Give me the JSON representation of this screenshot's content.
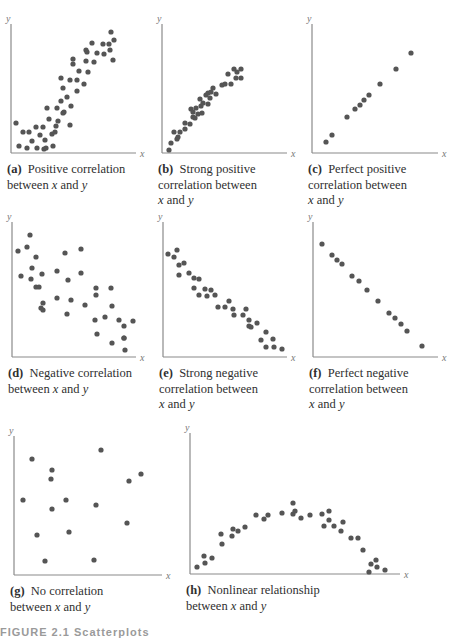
{
  "figure_label": "FIGURE 2.1 Scatterplots",
  "chart_data": [
    {
      "id": "a",
      "type": "scatter",
      "title": "(a) Positive correlation between x and y",
      "letter": "(a)",
      "caption_lines": [
        "Positive correlation",
        "between x and y"
      ],
      "xlabel": "x",
      "ylabel": "y",
      "axes": {
        "x0": 11,
        "y0": 153,
        "x1": 136,
        "ytop": 24
      },
      "points": [
        [
          16,
          123
        ],
        [
          19,
          146
        ],
        [
          23,
          132
        ],
        [
          27,
          148
        ],
        [
          29,
          132
        ],
        [
          32,
          141
        ],
        [
          36,
          127
        ],
        [
          37,
          148
        ],
        [
          40,
          135
        ],
        [
          43,
          127
        ],
        [
          44,
          149
        ],
        [
          45,
          140
        ],
        [
          46,
          148
        ],
        [
          47,
          108
        ],
        [
          49,
          119
        ],
        [
          52,
          134
        ],
        [
          53,
          146
        ],
        [
          55,
          132
        ],
        [
          56,
          126
        ],
        [
          57,
          108
        ],
        [
          58,
          121
        ],
        [
          61,
          101
        ],
        [
          63,
          113
        ],
        [
          64,
          112
        ],
        [
          61,
          78
        ],
        [
          63,
          88
        ],
        [
          67,
          97
        ],
        [
          70,
          125
        ],
        [
          71,
          106
        ],
        [
          70,
          80
        ],
        [
          73,
          59
        ],
        [
          73,
          64
        ],
        [
          77,
          91
        ],
        [
          77,
          80
        ],
        [
          79,
          71
        ],
        [
          84,
          84
        ],
        [
          86,
          50
        ],
        [
          86,
          61
        ],
        [
          87,
          52
        ],
        [
          88,
          72
        ],
        [
          92,
          43
        ],
        [
          94,
          62
        ],
        [
          97,
          53
        ],
        [
          103,
          44
        ],
        [
          104,
          54
        ],
        [
          109,
          44
        ],
        [
          110,
          50
        ],
        [
          111,
          32
        ],
        [
          114,
          40
        ],
        [
          113,
          60
        ]
      ]
    },
    {
      "id": "b",
      "type": "scatter",
      "title": "(b) Strong positive correlation between x and y",
      "letter": "(b)",
      "caption_lines": [
        "Strong positive",
        "correlation between",
        "x and y"
      ],
      "xlabel": "x",
      "ylabel": "y",
      "axes": {
        "x0": 162,
        "y0": 153,
        "x1": 287,
        "ytop": 24
      },
      "points": [
        [
          169,
          150
        ],
        [
          171,
          143
        ],
        [
          174,
          132
        ],
        [
          177,
          139
        ],
        [
          178,
          137
        ],
        [
          180,
          132
        ],
        [
          185,
          129
        ],
        [
          185,
          123
        ],
        [
          190,
          124
        ],
        [
          191,
          109
        ],
        [
          193,
          117
        ],
        [
          193,
          112
        ],
        [
          195,
          118
        ],
        [
          196,
          108
        ],
        [
          198,
          114
        ],
        [
          200,
          99
        ],
        [
          201,
          106
        ],
        [
          202,
          113
        ],
        [
          203,
          103
        ],
        [
          206,
          95
        ],
        [
          208,
          104
        ],
        [
          208,
          93
        ],
        [
          210,
          98
        ],
        [
          211,
          92
        ],
        [
          213,
          88
        ],
        [
          216,
          94
        ],
        [
          222,
          85
        ],
        [
          225,
          84
        ],
        [
          228,
          74
        ],
        [
          231,
          84
        ],
        [
          234,
          69
        ],
        [
          236,
          78
        ],
        [
          237,
          72
        ],
        [
          241,
          69
        ],
        [
          241,
          78
        ]
      ]
    },
    {
      "id": "c",
      "type": "scatter",
      "title": "(c) Perfect positive correlation between x and y",
      "letter": "(c)",
      "caption_lines": [
        "Perfect positive",
        "correlation between",
        "x and y"
      ],
      "xlabel": "x",
      "ylabel": "y",
      "axes": {
        "x0": 312,
        "y0": 153,
        "x1": 438,
        "ytop": 24
      },
      "points": [
        [
          326,
          142
        ],
        [
          332,
          135
        ],
        [
          347,
          117
        ],
        [
          355,
          109
        ],
        [
          360,
          105
        ],
        [
          364,
          100
        ],
        [
          369,
          95
        ],
        [
          380,
          84
        ],
        [
          396,
          69
        ],
        [
          411,
          53
        ]
      ]
    },
    {
      "id": "d",
      "type": "scatter",
      "title": "(d) Negative correlation between x and y",
      "letter": "(d)",
      "caption_lines": [
        "Negative correlation",
        "between x and y"
      ],
      "xlabel": "x",
      "ylabel": "y",
      "axes": {
        "x0": 12,
        "y0": 357,
        "x1": 136,
        "ytop": 222
      },
      "points": [
        [
          18,
          251
        ],
        [
          21,
          276
        ],
        [
          27,
          247
        ],
        [
          30,
          235
        ],
        [
          31,
          279
        ],
        [
          32,
          268
        ],
        [
          36,
          257
        ],
        [
          36,
          287
        ],
        [
          39,
          287
        ],
        [
          41,
          308
        ],
        [
          42,
          274
        ],
        [
          43,
          310
        ],
        [
          43,
          303
        ],
        [
          65,
          253
        ],
        [
          57,
          298
        ],
        [
          57,
          271
        ],
        [
          67,
          314
        ],
        [
          68,
          280
        ],
        [
          71,
          300
        ],
        [
          81,
          249
        ],
        [
          81,
          273
        ],
        [
          85,
          305
        ],
        [
          96,
          288
        ],
        [
          96,
          295
        ],
        [
          95,
          320
        ],
        [
          97,
          334
        ],
        [
          105,
          317
        ],
        [
          111,
          288
        ],
        [
          112,
          306
        ],
        [
          112,
          343
        ],
        [
          119,
          320
        ],
        [
          124,
          338
        ],
        [
          124,
          326
        ],
        [
          124,
          338
        ],
        [
          125,
          350
        ],
        [
          133,
          321
        ]
      ]
    },
    {
      "id": "e",
      "type": "scatter",
      "title": "(e) Strong negative correlation between x and y",
      "letter": "(e)",
      "caption_lines": [
        "Strong negative",
        "correlation between",
        "x and y"
      ],
      "xlabel": "x",
      "ylabel": "y",
      "axes": {
        "x0": 163,
        "y0": 357,
        "x1": 287,
        "ytop": 222
      },
      "points": [
        [
          168,
          254
        ],
        [
          174,
          257
        ],
        [
          177,
          250
        ],
        [
          179,
          265
        ],
        [
          179,
          275
        ],
        [
          184,
          263
        ],
        [
          189,
          273
        ],
        [
          194,
          278
        ],
        [
          194,
          288
        ],
        [
          199,
          279
        ],
        [
          199,
          295
        ],
        [
          205,
          289
        ],
        [
          207,
          296
        ],
        [
          211,
          290
        ],
        [
          215,
          295
        ],
        [
          218,
          307
        ],
        [
          225,
          307
        ],
        [
          229,
          301
        ],
        [
          233,
          309
        ],
        [
          234,
          315
        ],
        [
          243,
          315
        ],
        [
          246,
          309
        ],
        [
          249,
          320
        ],
        [
          249,
          326
        ],
        [
          251,
          327
        ],
        [
          257,
          323
        ],
        [
          261,
          340
        ],
        [
          266,
          332
        ],
        [
          266,
          347
        ],
        [
          273,
          339
        ],
        [
          274,
          347
        ],
        [
          282,
          349
        ]
      ]
    },
    {
      "id": "f",
      "type": "scatter",
      "title": "(f) Perfect negative correlation between x and y",
      "letter": "(f)",
      "caption_lines": [
        "Perfect negative",
        "correlation between",
        "x and y"
      ],
      "xlabel": "x",
      "ylabel": "y",
      "axes": {
        "x0": 313,
        "y0": 357,
        "x1": 438,
        "ytop": 222
      },
      "points": [
        [
          322,
          244
        ],
        [
          332,
          255
        ],
        [
          337,
          260
        ],
        [
          342,
          264
        ],
        [
          352,
          276
        ],
        [
          359,
          281
        ],
        [
          367,
          290
        ],
        [
          378,
          301
        ],
        [
          389,
          313
        ],
        [
          395,
          318
        ],
        [
          401,
          324
        ],
        [
          407,
          331
        ],
        [
          422,
          346
        ]
      ]
    },
    {
      "id": "g",
      "type": "scatter",
      "title": "(g) No correlation between x and y",
      "letter": "(g)",
      "caption_lines": [
        "No correlation",
        "between x and y"
      ],
      "xlabel": "x",
      "ylabel": "y",
      "axes": {
        "x0": 14,
        "y0": 575,
        "x1": 162,
        "ytop": 436
      },
      "points": [
        [
          23,
          500
        ],
        [
          32,
          459
        ],
        [
          37,
          535
        ],
        [
          45,
          561
        ],
        [
          51,
          479
        ],
        [
          52,
          470
        ],
        [
          52,
          509
        ],
        [
          66,
          500
        ],
        [
          69,
          532
        ],
        [
          96,
          505
        ],
        [
          94,
          560
        ],
        [
          101,
          450
        ],
        [
          127,
          523
        ],
        [
          129,
          481
        ],
        [
          141,
          474
        ]
      ]
    },
    {
      "id": "h",
      "type": "scatter",
      "title": "(h) Nonlinear relationship between x and y",
      "letter": "(h)",
      "caption_lines": [
        "Nonlinear relationship",
        "between x and y"
      ],
      "xlabel": "x",
      "ylabel": "y",
      "axes": {
        "x0": 190,
        "y0": 574,
        "x1": 400,
        "ytop": 433
      },
      "points": [
        [
          197,
          567
        ],
        [
          204,
          556
        ],
        [
          205,
          563
        ],
        [
          212,
          558
        ],
        [
          221,
          534
        ],
        [
          222,
          544
        ],
        [
          232,
          536
        ],
        [
          233,
          529
        ],
        [
          238,
          531
        ],
        [
          245,
          527
        ],
        [
          256,
          515
        ],
        [
          264,
          519
        ],
        [
          268,
          515
        ],
        [
          282,
          513
        ],
        [
          293,
          514
        ],
        [
          293,
          503
        ],
        [
          295,
          511
        ],
        [
          301,
          518
        ],
        [
          310,
          515
        ],
        [
          322,
          514
        ],
        [
          324,
          526
        ],
        [
          329,
          511
        ],
        [
          329,
          520
        ],
        [
          334,
          526
        ],
        [
          341,
          531
        ],
        [
          343,
          522
        ],
        [
          351,
          538
        ],
        [
          358,
          538
        ],
        [
          363,
          550
        ],
        [
          369,
          572
        ],
        [
          371,
          564
        ],
        [
          376,
          560
        ],
        [
          377,
          567
        ],
        [
          385,
          570
        ]
      ]
    }
  ]
}
